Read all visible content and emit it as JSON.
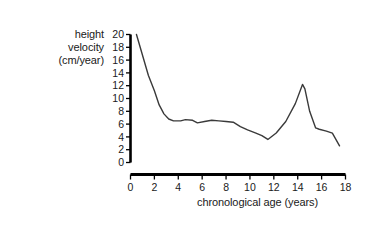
{
  "chart_data": {
    "type": "line",
    "title": "",
    "xlabel": "chronological age (years)",
    "ylabel": "height velocity (cm/year)",
    "ylabel_lines": [
      "height",
      "velocity",
      "(cm/year)"
    ],
    "xlim": [
      0,
      18
    ],
    "ylim": [
      0,
      20
    ],
    "grid": false,
    "legend": null,
    "line_color": "#3a3a3a",
    "axis_color": "#000000",
    "background_color": "#ffffff",
    "xticks": [
      0,
      2,
      4,
      6,
      8,
      10,
      12,
      14,
      16,
      18
    ],
    "xtick_labels": [
      "0",
      "2",
      "4",
      "6",
      "8",
      "10",
      "12",
      "14",
      "16",
      "18"
    ],
    "yticks": [
      0,
      2,
      4,
      6,
      8,
      10,
      12,
      14,
      16,
      18,
      20
    ],
    "ytick_labels": [
      "0",
      "2",
      "4",
      "6",
      "8",
      "10",
      "12",
      "14",
      "16",
      "18",
      "20"
    ],
    "series": [
      {
        "name": "height velocity",
        "x": [
          0.5,
          1.0,
          1.5,
          2.0,
          2.4,
          2.8,
          3.2,
          3.6,
          4.2,
          4.6,
          5.2,
          5.6,
          6.2,
          6.8,
          7.4,
          8.0,
          8.6,
          9.2,
          9.8,
          10.5,
          11.0,
          11.5,
          12.2,
          13.0,
          13.8,
          14.4,
          14.6,
          15.0,
          15.5,
          15.8,
          16.4,
          16.9,
          17.5
        ],
        "y": [
          20.0,
          16.8,
          13.6,
          11.2,
          9.0,
          7.6,
          6.8,
          6.5,
          6.5,
          6.7,
          6.6,
          6.2,
          6.4,
          6.6,
          6.5,
          6.4,
          6.3,
          5.6,
          5.1,
          4.6,
          4.2,
          3.6,
          4.6,
          6.4,
          9.2,
          12.2,
          11.5,
          8.0,
          5.4,
          5.2,
          4.9,
          4.6,
          2.6
        ]
      }
    ]
  },
  "axes": {
    "y_title_lines": [
      "height",
      "velocity",
      "(cm/year)"
    ],
    "x_title": "chronological age (years)"
  }
}
